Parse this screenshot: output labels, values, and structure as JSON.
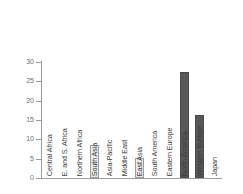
{
  "chart_data": {
    "type": "bar",
    "title": "",
    "subtitle": "",
    "xlabel": "",
    "ylabel": "",
    "ylim": [
      0,
      30
    ],
    "yticks": [
      0,
      5,
      10,
      15,
      20,
      25,
      30
    ],
    "grid": false,
    "legend": "none",
    "categories": [
      "Central Africa",
      "E. and S. Africa",
      "Northern Africa",
      "South Asia",
      "Asia-Pacific",
      "Middle East",
      "East Asia",
      "South America",
      "Eastern Europe",
      "North America",
      "Western Europe",
      "Japan"
    ],
    "values": [
      0,
      0,
      0,
      8.5,
      0,
      0,
      5.2,
      0,
      0,
      27.3,
      16.3,
      0
    ],
    "bar_colors": [
      "#e9e9e9",
      "#e9e9e9",
      "#e9e9e9",
      "#e9e9e9",
      "#e9e9e9",
      "#e9e9e9",
      "#e9e9e9",
      "#e9e9e9",
      "#e9e9e9",
      "#585858",
      "#585858",
      "#585858"
    ]
  },
  "axis": {
    "tick_labels": [
      "0",
      "5",
      "10",
      "15",
      "20",
      "25",
      "30"
    ],
    "line_color": "#9a9a9a",
    "tick_text_color": "#6e6e6e"
  },
  "style": {
    "background": "#ffffff",
    "light_bar_fill": "#e9e9e9",
    "light_bar_stroke": "#9d9d9d",
    "dark_bar_fill": "#585858",
    "dark_bar_stroke": "#4a4a4a",
    "category_text_color": "#3b3b3b"
  }
}
